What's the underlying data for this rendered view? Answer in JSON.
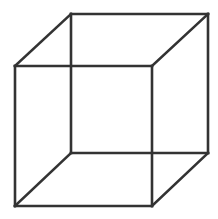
{
  "diagram": {
    "type": "wireframe-cube",
    "stroke_color": "#333333",
    "stroke_width": 2.6,
    "background": "#ffffff",
    "vertices": {
      "back_top_left": [
        71,
        14
      ],
      "back_top_right": [
        208,
        14
      ],
      "back_bottom_right": [
        208,
        153
      ],
      "back_bottom_left": [
        71,
        153
      ],
      "front_top_left": [
        15,
        66
      ],
      "front_top_right": [
        152,
        66
      ],
      "front_bottom_right": [
        152,
        206
      ],
      "front_bottom_left": [
        15,
        206
      ]
    },
    "edges": [
      [
        "back_top_left",
        "back_top_right"
      ],
      [
        "back_top_right",
        "back_bottom_right"
      ],
      [
        "back_bottom_right",
        "back_bottom_left"
      ],
      [
        "back_bottom_left",
        "back_top_left"
      ],
      [
        "front_top_left",
        "front_top_right"
      ],
      [
        "front_top_right",
        "front_bottom_right"
      ],
      [
        "front_bottom_right",
        "front_bottom_left"
      ],
      [
        "front_bottom_left",
        "front_top_left"
      ],
      [
        "front_top_left",
        "back_top_left"
      ],
      [
        "front_top_right",
        "back_top_right"
      ],
      [
        "front_bottom_right",
        "back_bottom_right"
      ],
      [
        "front_bottom_left",
        "back_bottom_left"
      ]
    ]
  }
}
